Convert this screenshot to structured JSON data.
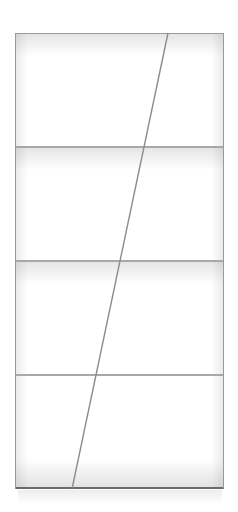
{
  "image": {
    "subject": "bookshelf",
    "description": "Tall white bookcase with four compartments and a diagonal divider",
    "compartments": 4,
    "colors": {
      "background": "#ffffff",
      "frame": "#9a9a9a",
      "shelf": "#a8a8a8",
      "diagonal": "#8c8c8c"
    }
  }
}
